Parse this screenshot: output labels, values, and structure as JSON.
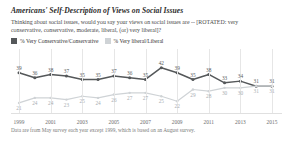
{
  "header": {
    "title": "Americans' Self-Description of Views on Social Issues",
    "subtitle": "Thinking about social issues, would you say your views on social issues are -- [ROTATED: very conservative, conservative, moderate, liberal, (or) very liberal]?"
  },
  "footnote": "Data are from May survey each year except 1999, which is based on an August survey.",
  "colors": {
    "conservative": "#55585a",
    "liberal": "#cfd3d6",
    "grid": "#e6e6e6",
    "axis_text": "#6d6d6d"
  },
  "chart_data": {
    "type": "line",
    "title": "Americans' Self-Description of Views on Social Issues",
    "xlabel": "",
    "ylabel": "",
    "ylim": [
      15,
      46
    ],
    "grid": true,
    "legend_position": "top",
    "x": [
      1999,
      2000,
      2001,
      2002,
      2003,
      2004,
      2005,
      2006,
      2007,
      2008,
      2009,
      2010,
      2011,
      2012,
      2013,
      2014,
      2015
    ],
    "tick_labels": [
      "1999",
      "2001",
      "2003",
      "2005",
      "2007",
      "2009",
      "2011",
      "2013",
      "2015"
    ],
    "series": [
      {
        "name": "% Very Conservative/Conservative",
        "color": "#55585a",
        "values": [
          39,
          36,
          38,
          37,
          35,
          35,
          37,
          36,
          35,
          42,
          39,
          35,
          38,
          33,
          34,
          31,
          31
        ]
      },
      {
        "name": "% Very liberal/Liberal",
        "color": "#cfd3d6",
        "values": [
          21,
          24,
          24,
          23,
          25,
          24,
          26,
          27,
          27,
          25,
          22,
          29,
          28,
          30,
          30,
          31,
          31
        ]
      }
    ]
  }
}
